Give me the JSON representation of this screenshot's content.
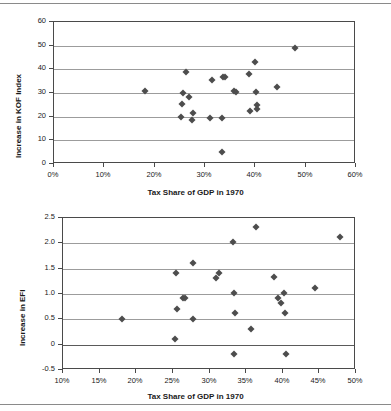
{
  "page": {
    "rule_top_label": "page-rule-top",
    "rule_bottom_label": "page-rule-bottom"
  },
  "chart_data": [
    {
      "id": "kof-chart",
      "type": "scatter",
      "title": "",
      "xlabel": "Tax Share of GDP in 1970",
      "ylabel": "Increase in KOF Index",
      "xlim": [
        0,
        60
      ],
      "ylim": [
        0,
        60
      ],
      "xticks": [
        0,
        10,
        20,
        30,
        40,
        50,
        60
      ],
      "xtick_labels": [
        "0%",
        "10%",
        "20%",
        "30%",
        "40%",
        "50%",
        "60%"
      ],
      "yticks": [
        0,
        10,
        20,
        30,
        40,
        50,
        60
      ],
      "ytick_labels": [
        "0",
        "10",
        "20",
        "30",
        "40",
        "50",
        "60"
      ],
      "grid": "horizontal",
      "legend": "none",
      "marker": "diamond",
      "marker_color": "#4d4d4d",
      "points": [
        {
          "x": 18.1,
          "y": 30.9
        },
        {
          "x": 25.3,
          "y": 19.9
        },
        {
          "x": 25.4,
          "y": 25.4
        },
        {
          "x": 25.6,
          "y": 29.8
        },
        {
          "x": 26.3,
          "y": 38.7
        },
        {
          "x": 26.8,
          "y": 28.5
        },
        {
          "x": 27.4,
          "y": 18.8
        },
        {
          "x": 27.6,
          "y": 21.4
        },
        {
          "x": 30.9,
          "y": 19.6
        },
        {
          "x": 31.3,
          "y": 35.3
        },
        {
          "x": 33.3,
          "y": 4.9
        },
        {
          "x": 33.4,
          "y": 19.6
        },
        {
          "x": 33.6,
          "y": 36.7
        },
        {
          "x": 34.0,
          "y": 36.6
        },
        {
          "x": 35.7,
          "y": 31.0
        },
        {
          "x": 36.2,
          "y": 30.4
        },
        {
          "x": 38.7,
          "y": 38.2
        },
        {
          "x": 39.0,
          "y": 22.4
        },
        {
          "x": 40.0,
          "y": 43.1
        },
        {
          "x": 40.2,
          "y": 30.6
        },
        {
          "x": 40.3,
          "y": 24.9
        },
        {
          "x": 40.4,
          "y": 23.2
        },
        {
          "x": 44.3,
          "y": 32.4
        },
        {
          "x": 47.9,
          "y": 49.1
        }
      ]
    },
    {
      "id": "efi-chart",
      "type": "scatter",
      "title": "",
      "xlabel": "Tax Share of GDP in 1970",
      "ylabel": "Increase in EFI",
      "xlim": [
        10,
        50
      ],
      "ylim": [
        -0.5,
        2.5
      ],
      "xticks": [
        10,
        15,
        20,
        25,
        30,
        35,
        40,
        45,
        50
      ],
      "xtick_labels": [
        "10%",
        "15%",
        "20%",
        "25%",
        "30%",
        "35%",
        "40%",
        "45%",
        "50%"
      ],
      "yticks": [
        -0.5,
        0,
        0.5,
        1.0,
        1.5,
        2.0,
        2.5
      ],
      "ytick_labels": [
        "-0.5",
        "0",
        "0.5",
        "1.0",
        "1.5",
        "2.0",
        "2.5"
      ],
      "grid": "horizontal",
      "legend": "none",
      "marker": "diamond",
      "marker_color": "#4d4d4d",
      "points": [
        {
          "x": 18.1,
          "y": 0.51
        },
        {
          "x": 25.3,
          "y": 0.11
        },
        {
          "x": 25.4,
          "y": 1.42
        },
        {
          "x": 25.5,
          "y": 0.71
        },
        {
          "x": 26.4,
          "y": 0.92
        },
        {
          "x": 26.7,
          "y": 0.92
        },
        {
          "x": 27.7,
          "y": 1.62
        },
        {
          "x": 27.8,
          "y": 0.51
        },
        {
          "x": 30.9,
          "y": 1.32
        },
        {
          "x": 31.3,
          "y": 1.42
        },
        {
          "x": 33.2,
          "y": 2.02
        },
        {
          "x": 33.3,
          "y": -0.18
        },
        {
          "x": 33.4,
          "y": 1.02
        },
        {
          "x": 33.5,
          "y": 0.62
        },
        {
          "x": 35.6,
          "y": 0.31
        },
        {
          "x": 36.3,
          "y": 2.33
        },
        {
          "x": 38.8,
          "y": 1.33
        },
        {
          "x": 39.3,
          "y": 0.92
        },
        {
          "x": 39.8,
          "y": 0.82
        },
        {
          "x": 40.2,
          "y": 1.02
        },
        {
          "x": 40.3,
          "y": 0.62
        },
        {
          "x": 40.4,
          "y": -0.18
        },
        {
          "x": 44.4,
          "y": 1.12
        },
        {
          "x": 47.8,
          "y": 2.13
        }
      ]
    }
  ]
}
